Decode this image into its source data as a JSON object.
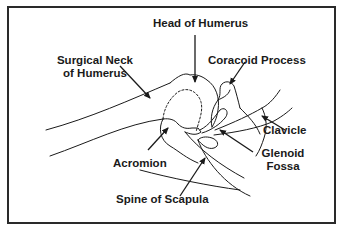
{
  "diagram": {
    "labels": {
      "head_of_humerus": "Head of Humerus",
      "surgical_neck_line1": "Surgical Neck",
      "surgical_neck_line2": "of Humerus",
      "coracoid_process": "Coracoid Process",
      "clavicle": "Clavicle",
      "acromion": "Acromion",
      "glenoid_fossa_line1": "Glenoid",
      "glenoid_fossa_line2": "Fossa",
      "spine_of_scapula": "Spine of Scapula"
    },
    "colors": {
      "line": "#1a1a1a",
      "frame": "#2a2a2a",
      "background": "#ffffff"
    }
  }
}
